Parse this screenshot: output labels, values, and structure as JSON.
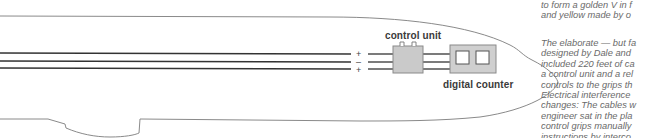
{
  "diagram": {
    "components": {
      "control_unit": {
        "label": "control unit",
        "fill": "#c8c8c8"
      },
      "digital_counter": {
        "label": "digital counter",
        "fill": "#cfcfcf"
      }
    },
    "wires": {
      "polarity": [
        "+",
        "–",
        "+"
      ],
      "color": "#333333"
    },
    "outline_color": "#7a7a7a"
  },
  "captions": {
    "top_block": [
      "to form a golden V in f",
      "and yellow made by o"
    ],
    "bottom_block": [
      "The elaborate — but fa",
      "designed by Dale and",
      "included 220 feet of ca",
      "a control unit and a rel",
      "controls to the grips th",
      "Electrical interference",
      "changes: The cables w",
      "engineer sat in the pla",
      "control grips manually",
      "instructions by interco"
    ]
  }
}
